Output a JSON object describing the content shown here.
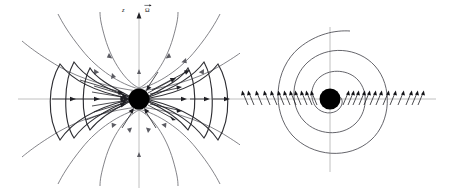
{
  "figure": {
    "panels": [
      {
        "id": "meridional-view",
        "name": "poloidal-plane-view",
        "view": "meridional (containing rotation axis)",
        "labels": {
          "vertical_axis": "z",
          "rotation_vector": "Ω",
          "rotation_vector_has_overbar": "true"
        },
        "central_object": {
          "name": "central-star",
          "shape": "filled circle",
          "color": "#000000",
          "center_x": 139,
          "center_y": 99,
          "radius": 10.5
        },
        "axes": {
          "horizontal": {
            "y": 99,
            "x_start": 18,
            "x_end": 252,
            "color": "#b9b9b9"
          },
          "vertical": {
            "x": 139,
            "y_top": 14,
            "y_bottom": 188,
            "color": "#b9b9b9",
            "arrowhead": "up"
          }
        },
        "field_lines": {
          "type": "dipolar poloidal field lines",
          "count": 12,
          "color": "#6e6e74",
          "arrow_direction": "outward along field lines (up near axis)"
        },
        "surfaces": {
          "type": "bowl / lens shaped flux surfaces",
          "count": 6,
          "color": "#2e2e33",
          "description": "three nested concave surfaces on each side of the star"
        },
        "radial_arrows": {
          "description": "arrows converging toward and diverging from the centre along the equatorial plane and oblique directions",
          "count": 22,
          "color": "#1f1f24"
        }
      },
      {
        "id": "equatorial-view",
        "name": "equatorial-plane-view",
        "view": "equatorial (perpendicular to rotation axis)",
        "central_object": {
          "name": "central-star",
          "shape": "filled circle",
          "color": "#000000",
          "center_x": 90,
          "center_y": 99,
          "radius": 10.5
        },
        "axes": {
          "horizontal": {
            "y": 99,
            "x_start": 0,
            "x_end": 196,
            "color": "#b9b9b9"
          },
          "vertical": {
            "x": 90,
            "y_top": 27,
            "y_bottom": 172,
            "color": "#b9b9b9"
          }
        },
        "spiral": {
          "type": "Archimedean spiral",
          "turns": 3.25,
          "color": "#53535a",
          "description": "single spiral winding outward from the central object"
        },
        "radial_arrows": {
          "description": "short radial arrows along the horizontal axis pointing outward on both sides",
          "count_left": 13,
          "count_right": 13,
          "color": "#141418"
        }
      }
    ],
    "background_color": "#ffffff",
    "line_colors": {
      "axis": "#b9b9b9",
      "field_line": "#6e6e74",
      "surface": "#2e2e33",
      "spiral": "#53535a",
      "arrow": "#1f1f24",
      "star": "#000000"
    }
  }
}
